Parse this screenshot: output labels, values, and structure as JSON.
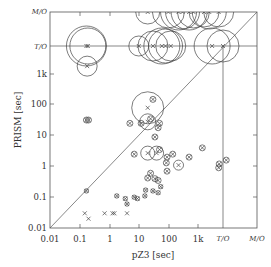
{
  "chart_data": {
    "type": "scatter",
    "title": "",
    "xlabel": "pZ3 [sec]",
    "ylabel": "PRISM [sec]",
    "scale": "log",
    "x_ticks": [
      "0.01",
      "0.1",
      "1",
      "10",
      "100",
      "1k",
      "T/O",
      "M/O"
    ],
    "y_ticks": [
      "0.01",
      "0.1",
      "1",
      "10",
      "100",
      "1k",
      "T/O",
      "M/O"
    ],
    "xlim": [
      "0.01",
      "M/O"
    ],
    "ylim": [
      "0.01",
      "M/O"
    ],
    "reference_lines": [
      "diagonal y=x",
      "horizontal at T/O",
      "vertical at T/O"
    ],
    "marker_legend": "x = run time point; circle radius indicates variance",
    "points": [
      {
        "x": 0.17,
        "y": 0.16
      },
      {
        "x": 0.15,
        "y": 0.03
      },
      {
        "x": 0.2,
        "y": 0.02
      },
      {
        "x": 0.7,
        "y": 0.03
      },
      {
        "x": 1.3,
        "y": 0.03
      },
      {
        "x": 1.5,
        "y": 0.03
      },
      {
        "x": 4,
        "y": 0.03
      },
      {
        "x": 4,
        "y": 0.06
      },
      {
        "x": 1.8,
        "y": 0.11
      },
      {
        "x": 3.5,
        "y": 0.09
      },
      {
        "x": 7,
        "y": 0.1
      },
      {
        "x": 9,
        "y": 0.09
      },
      {
        "x": 16,
        "y": 0.11
      },
      {
        "x": 17,
        "y": 0.17
      },
      {
        "x": 30,
        "y": 0.16
      },
      {
        "x": 45,
        "y": 0.14
      },
      {
        "x": 55,
        "y": 0.22
      },
      {
        "x": 20,
        "y": 0.42
      },
      {
        "x": 25,
        "y": 0.6
      },
      {
        "x": 35,
        "y": 0.4
      },
      {
        "x": 45,
        "y": 0.35
      },
      {
        "x": 7,
        "y": 2.5
      },
      {
        "x": 20,
        "y": 2.7
      },
      {
        "x": 40,
        "y": 2.7
      },
      {
        "x": 50,
        "y": 3.5
      },
      {
        "x": 90,
        "y": 0.7
      },
      {
        "x": 85,
        "y": 1.3
      },
      {
        "x": 90,
        "y": 2.0
      },
      {
        "x": 140,
        "y": 2.5
      },
      {
        "x": 220,
        "y": 1.1
      },
      {
        "x": 500,
        "y": 2.0
      },
      {
        "x": 1400,
        "y": 4.0
      },
      {
        "x": 5000,
        "y": 0.9
      },
      {
        "x": 5200,
        "y": 1.2
      },
      {
        "x": 9000,
        "y": 1.6
      },
      {
        "x": 35,
        "y": 9
      },
      {
        "x": 5,
        "y": 25
      },
      {
        "x": 12,
        "y": 25
      },
      {
        "x": 20,
        "y": 28
      },
      {
        "x": 25,
        "y": 35
      },
      {
        "x": 45,
        "y": 18
      },
      {
        "x": 50,
        "y": 25
      },
      {
        "x": 0.17,
        "y": 32
      },
      {
        "x": 0.2,
        "y": 32
      },
      {
        "x": 20,
        "y": 80
      },
      {
        "x": 30,
        "y": 150
      },
      {
        "x": 0.18,
        "y": 1800
      },
      {
        "x": 0.17,
        "y": "T/O"
      },
      {
        "x": 0.19,
        "y": "T/O"
      },
      {
        "x": 10,
        "y": "T/O"
      },
      {
        "x": 30,
        "y": "T/O"
      },
      {
        "x": 60,
        "y": "T/O"
      },
      {
        "x": 80,
        "y": "T/O"
      },
      {
        "x": 120,
        "y": "T/O"
      },
      {
        "x": 3000,
        "y": "T/O"
      },
      {
        "x": "T/O",
        "y": "T/O"
      },
      {
        "x": 20,
        "y": "M/O"
      },
      {
        "x": 100,
        "y": "M/O"
      },
      {
        "x": 220,
        "y": "M/O"
      },
      {
        "x": 300,
        "y": "M/O"
      },
      {
        "x": 500,
        "y": "M/O"
      },
      {
        "x": 700,
        "y": "M/O"
      },
      {
        "x": 1600,
        "y": "M/O"
      },
      {
        "x": 2400,
        "y": "M/O"
      },
      {
        "x": 5000,
        "y": "M/O"
      }
    ]
  },
  "axes": {
    "xlabel": "pZ3 [sec]",
    "ylabel": "PRISM [sec]",
    "xticks": [
      "0.01",
      "0.1",
      "1",
      "10",
      "100",
      "1k"
    ],
    "yticks": [
      "0.01",
      "0.1",
      "1",
      "10",
      "100",
      "1k"
    ],
    "to_label": "T/O",
    "mo_label": "M/O"
  }
}
